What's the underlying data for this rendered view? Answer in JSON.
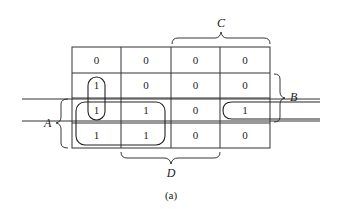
{
  "diagram": {
    "type": "karnaugh-map",
    "caption": "(a)",
    "variable_labels": {
      "A": "A",
      "B": "B",
      "C": "C",
      "D": "D"
    },
    "cells": [
      [
        "0",
        "0",
        "0",
        "0"
      ],
      [
        "1",
        "0",
        "0",
        "0"
      ],
      [
        "1",
        "1",
        "0",
        "1"
      ],
      [
        "1",
        "1",
        "0",
        "0"
      ]
    ],
    "groupings": [
      {
        "name": "vertical-pair",
        "cells": "column 1, rows 2-3"
      },
      {
        "name": "quad",
        "cells": "columns 1-2, rows 3-4"
      },
      {
        "name": "wraparound-pair",
        "cells": "row 3, columns 1 and 4"
      }
    ]
  }
}
